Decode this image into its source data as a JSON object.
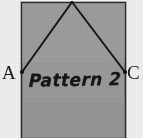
{
  "figure": {
    "name": "geometry-sketch",
    "background_color": "#f2f1ef",
    "rectangle": {
      "fill_color": "#9b9b9b",
      "stroke_color": "#2b2b2b",
      "x": 21,
      "y": 2,
      "width": 105,
      "height": 136
    },
    "triangle": {
      "stroke_color": "#171717",
      "apex": {
        "x": 72,
        "y": 2
      },
      "left_vertex": {
        "x": 22,
        "y": 72,
        "label": "A"
      },
      "right_vertex": {
        "x": 125,
        "y": 72,
        "label": "C"
      }
    },
    "vertex_labels": [
      {
        "id": "A",
        "text": "A"
      },
      {
        "id": "C",
        "text": "C"
      }
    ],
    "caption": "Pattern 2"
  }
}
